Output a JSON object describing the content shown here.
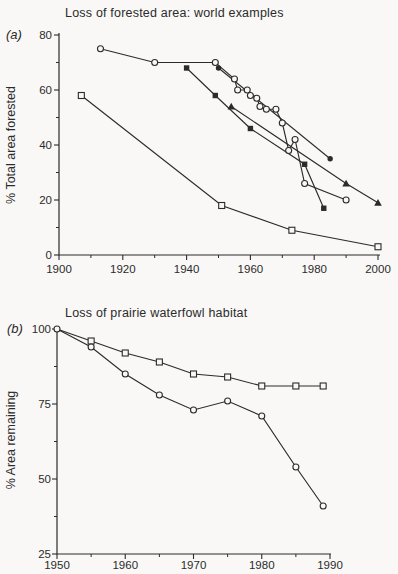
{
  "page": {
    "background": "#f9f8f6",
    "ink": "#2b2b2b"
  },
  "chart_data": [
    {
      "type": "line",
      "panel_label": "(a)",
      "title": "Loss of forested area: world examples",
      "xlabel": "",
      "ylabel": "% Total area forested",
      "xlim": [
        1900,
        2000
      ],
      "ylim": [
        0,
        80
      ],
      "xticks": [
        1900,
        1920,
        1940,
        1960,
        1980,
        2000
      ],
      "xticks_minor": [
        1910,
        1930,
        1950,
        1970,
        1990
      ],
      "yticks": [
        0,
        20,
        40,
        60,
        80
      ],
      "yticks_minor": [
        10,
        30,
        50,
        70
      ],
      "grid": false,
      "legend": "none",
      "series": [
        {
          "name": "open-circle-series",
          "marker": "circle-open",
          "points": [
            [
              1913,
              75
            ],
            [
              1930,
              70
            ],
            [
              1949,
              70
            ],
            [
              1955,
              64
            ],
            [
              1956,
              60
            ],
            [
              1959,
              60
            ],
            [
              1960,
              58
            ],
            [
              1962,
              57
            ],
            [
              1963,
              54
            ],
            [
              1965,
              53
            ],
            [
              1968,
              53
            ],
            [
              1970,
              48
            ],
            [
              1972,
              38
            ],
            [
              1974,
              42
            ],
            [
              1977,
              26
            ],
            [
              1990,
              20
            ]
          ]
        },
        {
          "name": "filled-circle-series",
          "marker": "circle-filled",
          "points": [
            [
              1950,
              68
            ],
            [
              1985,
              35
            ]
          ]
        },
        {
          "name": "filled-square-series",
          "marker": "square-filled",
          "points": [
            [
              1940,
              68
            ],
            [
              1949,
              58
            ],
            [
              1960,
              46
            ],
            [
              1977,
              33
            ],
            [
              1983,
              17
            ]
          ]
        },
        {
          "name": "filled-triangle-series",
          "marker": "triangle-filled",
          "points": [
            [
              1954,
              54
            ],
            [
              1990,
              26
            ],
            [
              2000,
              19
            ]
          ]
        },
        {
          "name": "open-square-series",
          "marker": "square-open",
          "points": [
            [
              1907,
              58
            ],
            [
              1951,
              18
            ],
            [
              1973,
              9
            ],
            [
              2000,
              3
            ]
          ]
        }
      ]
    },
    {
      "type": "line",
      "panel_label": "(b)",
      "title": "Loss of prairie waterfowl habitat",
      "xlabel": "",
      "ylabel": "% Area remaining",
      "xlim": [
        1950,
        1990
      ],
      "ylim": [
        25,
        100
      ],
      "xticks": [
        1950,
        1960,
        1970,
        1980,
        1990
      ],
      "xticks_minor": [
        1955,
        1965,
        1975,
        1985
      ],
      "yticks": [
        25,
        50,
        75,
        100
      ],
      "yticks_minor": [
        37.5,
        62.5,
        87.5
      ],
      "grid": false,
      "legend": "none",
      "series": [
        {
          "name": "open-square-series",
          "marker": "square-open",
          "skip_first_marker": true,
          "points": [
            [
              1950,
              100
            ],
            [
              1955,
              96
            ],
            [
              1960,
              92
            ],
            [
              1965,
              89
            ],
            [
              1970,
              85
            ],
            [
              1975,
              84
            ],
            [
              1980,
              81
            ],
            [
              1985,
              81
            ],
            [
              1989,
              81
            ]
          ]
        },
        {
          "name": "open-circle-series",
          "marker": "circle-open",
          "points": [
            [
              1950,
              100
            ],
            [
              1955,
              94
            ],
            [
              1960,
              85
            ],
            [
              1965,
              78
            ],
            [
              1970,
              73
            ],
            [
              1975,
              76
            ],
            [
              1980,
              71
            ],
            [
              1985,
              54
            ],
            [
              1989,
              41
            ]
          ]
        }
      ]
    }
  ]
}
